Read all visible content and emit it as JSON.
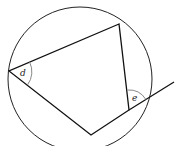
{
  "diagram": {
    "type": "cyclic-quadrilateral",
    "circle": {
      "cx": 80,
      "cy": 79,
      "r": 72
    },
    "vertices": {
      "top": [
        119,
        24
      ],
      "left": [
        9,
        71
      ],
      "bottom": [
        91,
        135
      ],
      "right": [
        129,
        110
      ]
    },
    "extension_end": [
      174,
      82
    ],
    "angle_labels": {
      "d": "d",
      "e": "e"
    },
    "colors": {
      "line": "#111111",
      "arc": "#888888"
    }
  }
}
